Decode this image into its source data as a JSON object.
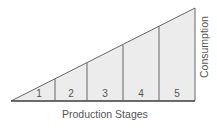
{
  "diagram": {
    "type": "hayekian-triangle",
    "x_axis_label": "Production Stages",
    "y_axis_label": "Consumption",
    "stages": [
      "1",
      "2",
      "3",
      "4",
      "5"
    ],
    "colors": {
      "fill": "#ececec",
      "stroke": "#555555",
      "text": "#555555"
    }
  }
}
